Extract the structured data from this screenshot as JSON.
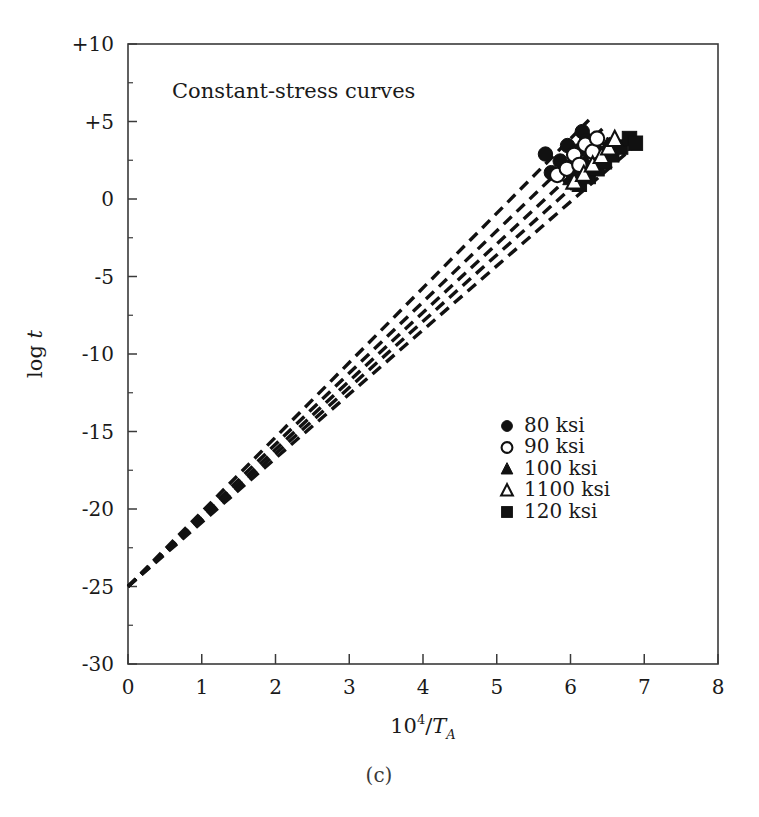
{
  "figure": {
    "caption": "(c)",
    "note": "Constant-stress curves"
  },
  "chart_data": {
    "type": "scatter",
    "title": "Constant-stress curves",
    "xlabel": "10^4/T_A",
    "xlabel_parts": {
      "base": "10",
      "exponent": "4",
      "divider": "/",
      "symbol": "T",
      "subscript": "A"
    },
    "ylabel": "log t",
    "ylabel_parts": {
      "prefix": "log ",
      "variable": "t"
    },
    "xlim": [
      0,
      8
    ],
    "ylim": [
      -30,
      10
    ],
    "x_ticks": [
      0,
      1,
      2,
      3,
      4,
      5,
      6,
      7,
      8
    ],
    "x_tick_labels": [
      "0",
      "1",
      "2",
      "3",
      "4",
      "5",
      "6",
      "7",
      "8"
    ],
    "y_ticks": [
      10,
      5,
      0,
      -5,
      -10,
      -15,
      -20,
      -25,
      -30
    ],
    "y_tick_labels": [
      "+10",
      "+5",
      "0",
      "-5",
      "-10",
      "-15",
      "-20",
      "-25",
      "-30"
    ],
    "y_minor_ticks": [
      7.5,
      2.5,
      -2.5,
      -7.5,
      -12.5,
      -17.5,
      -22.5,
      -27.5
    ],
    "grid": false,
    "frame": "box",
    "legend_position": "center-right",
    "line_style": "dashed",
    "common_intercept": {
      "x": 0,
      "y": -25
    },
    "series": [
      {
        "name": "80 ksi",
        "marker": "filled-circle",
        "color": "#111111",
        "line": {
          "x0": 0,
          "y0": -25,
          "x1": 6.25,
          "y1": 5.1
        },
        "points": [
          {
            "x": 5.66,
            "y": 2.9
          },
          {
            "x": 5.74,
            "y": 1.7
          },
          {
            "x": 5.86,
            "y": 2.45
          },
          {
            "x": 5.96,
            "y": 3.45
          },
          {
            "x": 6.02,
            "y": 2.1
          },
          {
            "x": 6.1,
            "y": 3.1
          },
          {
            "x": 6.16,
            "y": 4.35
          },
          {
            "x": 6.22,
            "y": 3.8
          }
        ]
      },
      {
        "name": "90 ksi",
        "marker": "open-circle",
        "color": "#111111",
        "line": {
          "x0": 0,
          "y0": -25,
          "x1": 6.45,
          "y1": 4.6
        },
        "points": [
          {
            "x": 5.82,
            "y": 1.55
          },
          {
            "x": 5.95,
            "y": 1.95
          },
          {
            "x": 6.05,
            "y": 2.85
          },
          {
            "x": 6.12,
            "y": 2.2
          },
          {
            "x": 6.2,
            "y": 3.5
          },
          {
            "x": 6.3,
            "y": 3.05
          },
          {
            "x": 6.36,
            "y": 3.9
          }
        ]
      },
      {
        "name": "100 ksi",
        "marker": "filled-triangle",
        "color": "#111111",
        "line": {
          "x0": 0,
          "y0": -25,
          "x1": 6.62,
          "y1": 4.25
        },
        "points": [
          {
            "x": 6.0,
            "y": 1.35
          },
          {
            "x": 6.1,
            "y": 1.85
          },
          {
            "x": 6.2,
            "y": 2.45
          },
          {
            "x": 6.3,
            "y": 2.1
          },
          {
            "x": 6.4,
            "y": 3.0
          },
          {
            "x": 6.5,
            "y": 3.45
          }
        ]
      },
      {
        "name": "1100 ksi",
        "marker": "open-triangle",
        "color": "#111111",
        "line": {
          "x0": 0,
          "y0": -25,
          "x1": 6.78,
          "y1": 4.0
        },
        "points": [
          {
            "x": 6.05,
            "y": 1.1
          },
          {
            "x": 6.18,
            "y": 1.6
          },
          {
            "x": 6.3,
            "y": 2.2
          },
          {
            "x": 6.42,
            "y": 2.75
          },
          {
            "x": 6.52,
            "y": 3.3
          },
          {
            "x": 6.6,
            "y": 3.85
          }
        ]
      },
      {
        "name": "120 ksi",
        "marker": "filled-square",
        "color": "#111111",
        "line": {
          "x0": 0,
          "y0": -25,
          "x1": 6.95,
          "y1": 3.75
        },
        "points": [
          {
            "x": 6.12,
            "y": 0.95
          },
          {
            "x": 6.24,
            "y": 1.45
          },
          {
            "x": 6.36,
            "y": 1.95
          },
          {
            "x": 6.46,
            "y": 2.4
          },
          {
            "x": 6.56,
            "y": 2.85
          },
          {
            "x": 6.68,
            "y": 3.35
          },
          {
            "x": 6.8,
            "y": 3.9
          },
          {
            "x": 6.88,
            "y": 3.6
          }
        ]
      }
    ],
    "legend_entries": [
      {
        "label": "80 ksi",
        "marker": "filled-circle"
      },
      {
        "label": "90 ksi",
        "marker": "open-circle"
      },
      {
        "label": "100 ksi",
        "marker": "filled-triangle"
      },
      {
        "label": "1100 ksi",
        "marker": "open-triangle"
      },
      {
        "label": "120 ksi",
        "marker": "filled-square"
      }
    ]
  }
}
